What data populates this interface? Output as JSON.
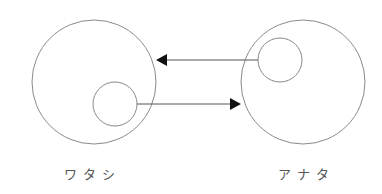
{
  "diagram": {
    "type": "relationship-diagram",
    "colors": {
      "stroke": "#8a8a8a",
      "arrow": "#555555",
      "arrowhead": "#111111",
      "label": "#555555",
      "background": "#ffffff"
    },
    "nodes": [
      {
        "id": "watashi",
        "label": "ワタシ",
        "outer_circle": {
          "cx": 94,
          "cy": 82,
          "r": 62
        },
        "inner_circle": {
          "cx": 115,
          "cy": 104,
          "r": 22
        },
        "label_pos": {
          "x": 92,
          "y": 164
        }
      },
      {
        "id": "anata",
        "label": "アナタ",
        "outer_circle": {
          "cx": 303,
          "cy": 82,
          "r": 62
        },
        "inner_circle": {
          "cx": 280,
          "cy": 60,
          "r": 22
        },
        "label_pos": {
          "x": 306,
          "y": 164
        }
      }
    ],
    "edges": [
      {
        "from": "anata-inner",
        "to": "watashi-outer",
        "x1": 258,
        "y1": 60,
        "x2": 156,
        "y2": 60,
        "direction": "left"
      },
      {
        "from": "watashi-inner",
        "to": "anata-outer",
        "x1": 137,
        "y1": 104,
        "x2": 241,
        "y2": 104,
        "direction": "right"
      }
    ]
  }
}
